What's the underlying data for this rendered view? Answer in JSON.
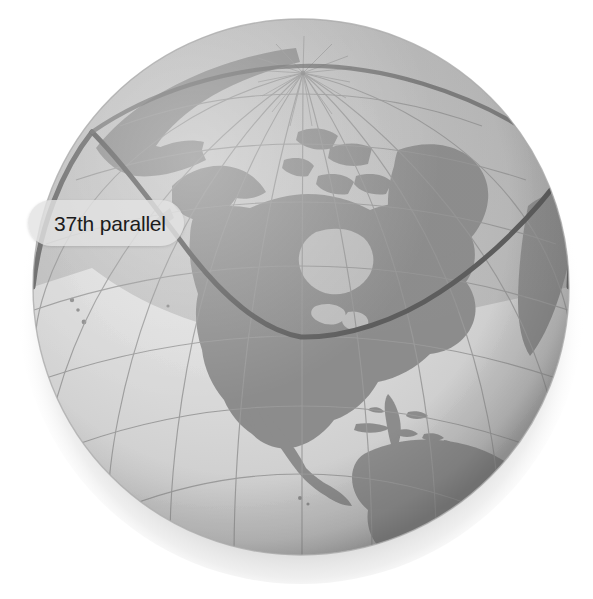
{
  "figure": {
    "kind": "globe-illustration",
    "background_color": "#ffffff"
  },
  "callout": {
    "label": "37th parallel",
    "text_color": "#1b1b1b",
    "pill_color": "#e2e2e2"
  },
  "globe": {
    "center_x": 301,
    "center_y": 287,
    "radius_x": 268,
    "radius_y": 268,
    "ocean_light_color": "#d8d8d8",
    "ocean_shaded_color": "#b9b9b9",
    "land_color": "#8e8e8e",
    "land_shaded_color": "#7c7c7c",
    "graticule_color": "#9d9d9d",
    "rim_color": "#a8a8a8",
    "shadow_color": "#bdbdbd"
  },
  "parallel": {
    "name": "37th parallel",
    "latitude_degrees": 37,
    "line_color": "#5d5d5d",
    "line_width_px": 5,
    "arc_low_point_y": 337,
    "arc_high_point_y": 118
  },
  "graticule": {
    "parallel_spacing_degrees": 15,
    "meridian_spacing_degrees": 15,
    "pole_visible": "north",
    "pole_x": 303,
    "pole_y": 73
  },
  "landmasses": [
    "North America",
    "South America",
    "Greenland",
    "Central America",
    "Caribbean islands",
    "Alaska",
    "Siberia",
    "West Africa"
  ]
}
